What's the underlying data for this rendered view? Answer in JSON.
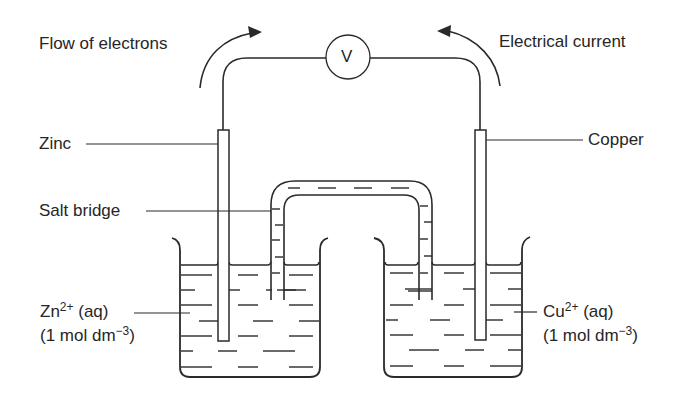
{
  "diagram": {
    "labels": {
      "flow_of_electrons": "Flow of electrons",
      "electrical_current": "Electrical current",
      "zinc": "Zinc",
      "copper": "Copper",
      "salt_bridge": "Salt bridge",
      "zn_ion": "Zn",
      "zn_charge": "2+",
      "zn_state": " (aq)",
      "zn_conc_open": "(1 mol dm",
      "zn_conc_exp": "−3",
      "zn_conc_close": ")",
      "cu_ion": "Cu",
      "cu_charge": "2+",
      "cu_state": " (aq)",
      "cu_conc_open": "(1 mol dm",
      "cu_conc_exp": "−3",
      "cu_conc_close": ")",
      "voltmeter": "V"
    },
    "components": [
      "voltmeter",
      "zinc electrode",
      "copper electrode",
      "salt bridge",
      "left beaker (Zn2+ solution)",
      "right beaker (Cu2+ solution)"
    ],
    "colors": {
      "stroke": "#2a2a2a",
      "background": "#ffffff"
    }
  }
}
